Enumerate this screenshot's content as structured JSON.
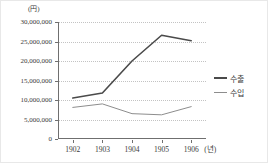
{
  "chart_data": {
    "type": "line",
    "title": "",
    "subtitle": "",
    "unit_label": "(円)",
    "xlabel": "(년)",
    "ylabel": "",
    "categories": [
      "1902",
      "1903",
      "1904",
      "1905",
      "1906"
    ],
    "x": [
      1902,
      1903,
      1904,
      1905,
      1906
    ],
    "series": [
      {
        "name": "수출",
        "color": "#4a4a4a",
        "width": 1.6,
        "values": [
          10500000,
          11800000,
          20000000,
          26600000,
          25200000
        ]
      },
      {
        "name": "수입",
        "color": "#8d8d8d",
        "width": 1.0,
        "values": [
          8100000,
          9000000,
          6500000,
          6200000,
          8300000
        ]
      }
    ],
    "ylim": [
      0,
      30000000
    ],
    "ytick_values": [
      30000000,
      25000000,
      20000000,
      15000000,
      10000000,
      5000000,
      0
    ],
    "ytick_labels": [
      "30,000,000",
      "25,000,000",
      "20,000,000",
      "15,000,000",
      "10,000,000",
      "5,000,000",
      "0"
    ],
    "xtick_labels": [
      "1902",
      "1903",
      "1904",
      "1905",
      "1906"
    ],
    "grid": true,
    "grid_style": "dotted",
    "grid_color": "#c3c3c3",
    "legend_position": "right",
    "legend_entries": [
      "수출",
      "수입"
    ],
    "axis_color": "#6f6f6f",
    "text_color": "#3a3a3a",
    "background": "#ffffff"
  }
}
